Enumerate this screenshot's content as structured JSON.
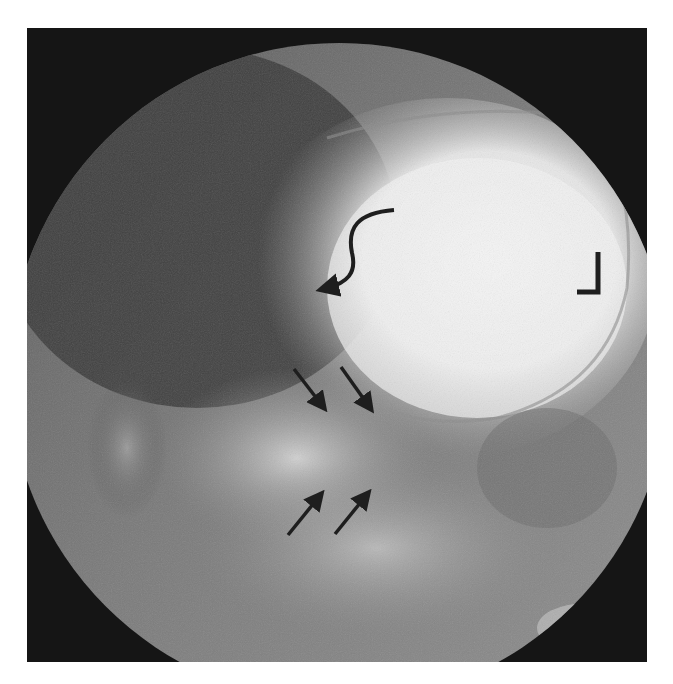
{
  "image": {
    "kind": "fluoroscopy radiograph",
    "colors": {
      "background": "#ffffff",
      "frame": "#151515",
      "annotation": "#1e1e1e"
    },
    "annotations": [
      {
        "type": "curved-arrow",
        "label": "curved arrow pointing to gastric fundus margin"
      },
      {
        "type": "arrow",
        "direction": "down-right",
        "label": "arrow 1"
      },
      {
        "type": "arrow",
        "direction": "down-right",
        "label": "arrow 2"
      },
      {
        "type": "arrow",
        "direction": "up-right",
        "label": "arrow 3"
      },
      {
        "type": "arrow",
        "direction": "up-right",
        "label": "arrow 4"
      },
      {
        "type": "L-marker",
        "label": "L"
      }
    ]
  }
}
